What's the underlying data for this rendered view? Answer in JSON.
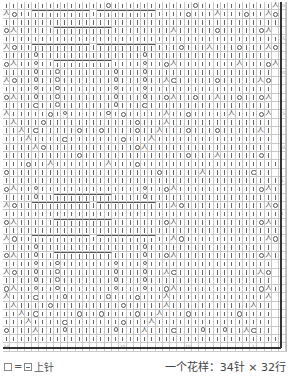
{
  "chart": {
    "columns": 39,
    "rows": 42,
    "symbols": {
      "|": "knit-stitch",
      "O": "yarn-over",
      "A": "k2tog-decrease",
      "8": "twisted-knit-column",
      "[": "cable-bracket",
      ".": "blank"
    },
    "row_data": [
      "||||||||||||||O|||||||||||O||||||||||A",
      "AO||[||||||]|[||||||]||||O|||A|||O||AO",
      "||||||||||||||||||||||||||||||||||||||",
      "OA|||||[||||||]||||||||A|||||O|||||OA",
      "||||||||||||||||||||||||||||||||||||||",
      "AO||[||||||]|[||||||]|||O|||A|||O|||AO",
      "||||8||||||||||||||8|||||||||||||||||",
      "OA||8||[||||||]||||8||OA||||||||A|||OA",
      "||||8||8|||||||8|||8|||||||||||||||||",
      "AO||8||8|||||||8|||8||AO|||||O|||||AO",
      "||||8||8|||||||8|||8|||||||||||||||||",
      "OA||8||8|||||||8|||8||OA||O||A||O||OA",
      "||||O||8|||||||8|||O|||||||||||||||||",
      "A|||||O|8|||||8|O|||||A||O|||||A|||OA",
      "|A|||O||||||||||||O|||A||||||||||||||",
      "||A|O|||||O||O||||O||A|||O|||O|||||A|",
      "|||A||||O|||||||O|||A||||||||||||||||",
      "||||AO||||||||||||OA|||||||||||||||||",
      "||||||||||O||||||||||||||O|||A|||||O|",
      "|||O||A|||||||A|||O|||||||||||||||||||",
      "O||||||||||||||||||||O|||||A||||||O||",
      "||||||||||||||||||||||||||||||||||||||",
      "OA||8||||||||||||||8||OA|||||||||||OA|",
      "||||8||[||||||]||||8||||||||||||||||||",
      "AO||[||||||]|[||||||]||AO|||||||||||AO",
      "||||||||||||||||||||||||||||||||||||||",
      "OA|||||[||||||]|||||||OA|||||||||||OA|",
      "||||||||||||||||||||||||||||||||||||||",
      "AO||[||||||]|[||||||]||AO|||||||||||AO",
      "||||8||||||||||||||8|||||||||||||||||",
      "OA||8||[||||||]||||8||OA|||||||||||OA|",
      "||||8||8|||||||8|||8|||||||||||||||||",
      "AO||8||8|||||||8|||8||AO|||||||||||AO",
      "||||8||8|||||||8|||8|||||||||||||||||",
      "OA||8||8|||||||8|||8||OA|||||||||||OA|",
      "A|||O|||8|||||8|||O|||A|||||||||||||A",
      "|A||||O|||||||||O|||||A|||||||||||A||",
      "||A|O|||||O||O||||O||A|||O||||||O||||",
      "|||A||||O|||||||O|||A||||||||||||||||",
      "O|||A|||8||||||8|||A|||O|||8||8||AO||",
      "||||||||||||||||||||||||||||||||||||||",
      "............................................"
    ],
    "bottom_numbers": [
      "34",
      "",
      "",
      "",
      "",
      "",
      "",
      "",
      "",
      "",
      "",
      "",
      "",
      "",
      "",
      "",
      "20",
      "",
      "",
      "",
      "",
      "",
      "",
      "",
      "",
      "10",
      "",
      "",
      "",
      "",
      "",
      "",
      "",
      "",
      "1"
    ],
    "right_numbers": [
      "30",
      "",
      "",
      "",
      "25",
      "",
      "",
      "",
      "20",
      "",
      "",
      "",
      "",
      "15",
      "",
      "",
      "",
      "10",
      "",
      "",
      "",
      "5",
      "",
      "",
      "",
      "1"
    ]
  },
  "legend": {
    "left_equals": "=",
    "left_label": "上针",
    "right_label": "一个花样：34针 × 32行"
  }
}
